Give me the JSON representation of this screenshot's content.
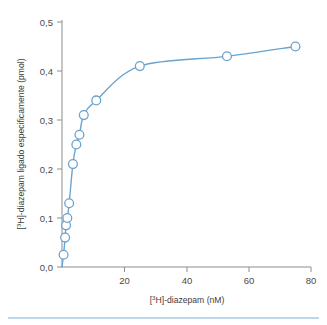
{
  "chart_data": {
    "type": "line",
    "title": "",
    "subtitle": "",
    "xlabel": "[3H]-diazepam (nM)",
    "xlabel_prefix": "[",
    "xlabel_sup": "3",
    "xlabel_suffix": "H]-diazepam (nM)",
    "ylabel": "[3H]-diazepam ligado especificamente (pmol)",
    "ylabel_prefix": "[",
    "ylabel_sup": "3",
    "ylabel_suffix": "H]-diazepam ligado especificamente (pmol)",
    "xlim": [
      0,
      80
    ],
    "ylim": [
      0.0,
      0.5
    ],
    "xticks": [
      20,
      40,
      60,
      80
    ],
    "xtick_labels": [
      "20",
      "40",
      "60",
      "80"
    ],
    "yticks": [
      0.0,
      0.1,
      0.2,
      0.3,
      0.4,
      0.5
    ],
    "ytick_labels": [
      "0,0",
      "0,1",
      "0,2",
      "0,3",
      "0,4",
      "0,5"
    ],
    "grid": false,
    "legend": false,
    "legend_position": "none",
    "decimal_separator": ",",
    "series": [
      {
        "name": "ligacao especifica",
        "marker": "open-circle",
        "color": "#6aa3ce",
        "x": [
          0.5,
          1.0,
          1.3,
          1.7,
          2.3,
          3.5,
          4.6,
          5.6,
          7.0,
          11.0,
          25.0,
          53.0,
          75.0
        ],
        "y": [
          0.025,
          0.06,
          0.085,
          0.1,
          0.13,
          0.21,
          0.25,
          0.27,
          0.31,
          0.34,
          0.41,
          0.43,
          0.45
        ]
      }
    ],
    "annotations": []
  },
  "figure": {
    "caption": "",
    "footer_rule_color": "#a9c9e3",
    "background": "#ffffff",
    "axis_color": "#8d8d8d",
    "accent_color": "#6aa3ce"
  }
}
